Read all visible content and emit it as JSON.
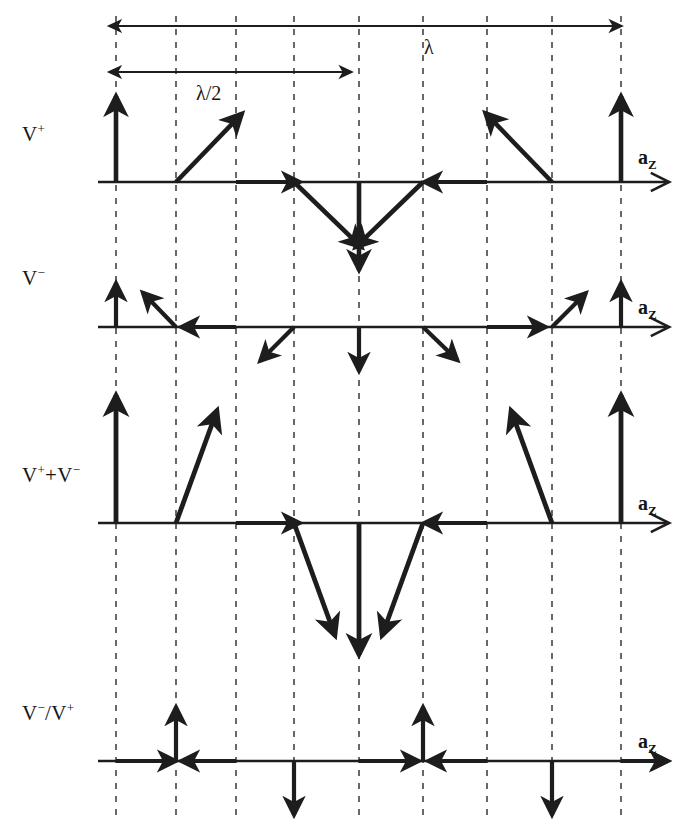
{
  "figure": {
    "type": "vector-phasor-diagram",
    "width": 695,
    "height": 823,
    "ink_color": "#1d1d1d",
    "grid_color": "#444444"
  },
  "span_markers": [
    {
      "name": "lambda",
      "label": "λ",
      "x_start": 116,
      "x_end": 621,
      "y": 26,
      "label_x": 424,
      "label_y": 36,
      "arrows": "both"
    },
    {
      "name": "lambda-half",
      "label": "λ/2",
      "x_start": 116,
      "x_end": 351,
      "y": 72,
      "label_x": 196,
      "label_y": 82,
      "arrows": "both"
    }
  ],
  "gridlines": {
    "x": [
      116,
      176,
      236,
      294,
      359,
      423,
      487,
      552,
      621
    ],
    "y_top": 16,
    "y_bottom": 818,
    "dash": "6 7",
    "width": 1.6
  },
  "axis_label": {
    "text": "a",
    "sub": "Z"
  },
  "rows": [
    {
      "id": "v-plus",
      "label": "V",
      "label_sup": "+",
      "label_x": 22,
      "label_y": 121,
      "axis_y": 182,
      "axis_x_start": 98,
      "axis_x_end": 666,
      "axis_label_x": 638,
      "axis_label_y": 146,
      "vectors": [
        {
          "gx": 116,
          "angle_deg": 90,
          "length": 86,
          "lw": 4.6
        },
        {
          "gx": 176,
          "angle_deg": 46,
          "length": 95,
          "lw": 4.6
        },
        {
          "gx": 236,
          "angle_deg": 0,
          "length": 0,
          "lw": 4.6
        },
        {
          "gx": 294,
          "angle_deg": -44,
          "length": 94,
          "lw": 4.6
        },
        {
          "gx": 359,
          "angle_deg": -90,
          "length": 88,
          "lw": 4.6
        },
        {
          "gx": 423,
          "angle_deg": -136,
          "length": 94,
          "lw": 4.6
        },
        {
          "gx": 487,
          "angle_deg": 180,
          "length": 0,
          "lw": 4.6
        },
        {
          "gx": 552,
          "angle_deg": 134,
          "length": 96,
          "lw": 4.6
        },
        {
          "gx": 621,
          "angle_deg": 90,
          "length": 86,
          "lw": 4.6
        }
      ],
      "inline_arrows": [
        {
          "x": 236,
          "dir": "right",
          "to": 300
        },
        {
          "x": 487,
          "dir": "left",
          "to": 424
        }
      ]
    },
    {
      "id": "v-minus",
      "label": "V",
      "label_sup": "−",
      "label_x": 22,
      "label_y": 265,
      "axis_y": 327,
      "axis_x_start": 98,
      "axis_x_end": 666,
      "axis_label_x": 638,
      "axis_label_y": 296,
      "vectors": [
        {
          "gx": 116,
          "angle_deg": 90,
          "length": 44,
          "lw": 4.2
        },
        {
          "gx": 176,
          "angle_deg": 134,
          "length": 48,
          "lw": 4.2
        },
        {
          "gx": 236,
          "angle_deg": 180,
          "length": 0,
          "lw": 4.2
        },
        {
          "gx": 294,
          "angle_deg": -135,
          "length": 48,
          "lw": 4.2
        },
        {
          "gx": 359,
          "angle_deg": -90,
          "length": 44,
          "lw": 4.2
        },
        {
          "gx": 423,
          "angle_deg": -44,
          "length": 48,
          "lw": 4.2
        },
        {
          "gx": 487,
          "angle_deg": 0,
          "length": 0,
          "lw": 4.2
        },
        {
          "gx": 552,
          "angle_deg": 45,
          "length": 48,
          "lw": 4.2
        },
        {
          "gx": 621,
          "angle_deg": 90,
          "length": 44,
          "lw": 4.2
        }
      ],
      "inline_arrows": [
        {
          "x": 236,
          "dir": "left",
          "to": 181
        },
        {
          "x": 487,
          "dir": "right",
          "to": 546
        }
      ]
    },
    {
      "id": "v-plus-plus-v-minus",
      "label": "V",
      "label_sup": "+",
      "label2": "+V",
      "label2_sup": "−",
      "label_x": 22,
      "label_y": 462,
      "axis_y": 523,
      "axis_x_start": 98,
      "axis_x_end": 666,
      "axis_label_x": 638,
      "axis_label_y": 492,
      "vectors": [
        {
          "gx": 116,
          "angle_deg": 90,
          "length": 128,
          "lw": 4.8
        },
        {
          "gx": 176,
          "angle_deg": 70,
          "length": 120,
          "lw": 4.8
        },
        {
          "gx": 236,
          "angle_deg": 0,
          "length": 0,
          "lw": 4.8
        },
        {
          "gx": 294,
          "angle_deg": -70,
          "length": 120,
          "lw": 4.8
        },
        {
          "gx": 359,
          "angle_deg": -90,
          "length": 132,
          "lw": 4.8
        },
        {
          "gx": 423,
          "angle_deg": -110,
          "length": 120,
          "lw": 4.8
        },
        {
          "gx": 487,
          "angle_deg": 180,
          "length": 0,
          "lw": 4.8
        },
        {
          "gx": 552,
          "angle_deg": 110,
          "length": 120,
          "lw": 4.8
        },
        {
          "gx": 621,
          "angle_deg": 90,
          "length": 128,
          "lw": 4.8
        }
      ],
      "inline_arrows": [
        {
          "x": 236,
          "dir": "right",
          "to": 300
        },
        {
          "x": 487,
          "dir": "left",
          "to": 424
        }
      ]
    },
    {
      "id": "v-minus-over-v-plus",
      "label": "V",
      "label_sup": "−",
      "label2": "/V",
      "label2_sup": "+",
      "label_x": 22,
      "label_y": 700,
      "axis_y": 761,
      "axis_x_start": 98,
      "axis_x_end": 666,
      "axis_label_x": 638,
      "axis_label_y": 730,
      "vectors": [
        {
          "gx": 116,
          "angle_deg": 0,
          "length": 0,
          "lw": 4.2
        },
        {
          "gx": 176,
          "angle_deg": 90,
          "length": 54,
          "lw": 4.2
        },
        {
          "gx": 236,
          "angle_deg": 180,
          "length": 0,
          "lw": 4.2
        },
        {
          "gx": 294,
          "angle_deg": -90,
          "length": 54,
          "lw": 4.2
        },
        {
          "gx": 359,
          "angle_deg": 0,
          "length": 0,
          "lw": 4.2
        },
        {
          "gx": 423,
          "angle_deg": 90,
          "length": 54,
          "lw": 4.2
        },
        {
          "gx": 487,
          "angle_deg": 180,
          "length": 0,
          "lw": 4.2
        },
        {
          "gx": 552,
          "angle_deg": -90,
          "length": 54,
          "lw": 4.2
        },
        {
          "gx": 621,
          "angle_deg": 0,
          "length": 0,
          "lw": 4.2
        }
      ],
      "inline_arrows": [
        {
          "x": 116,
          "dir": "right",
          "to": 176
        },
        {
          "x": 236,
          "dir": "left",
          "to": 181
        },
        {
          "x": 359,
          "dir": "right",
          "to": 419
        },
        {
          "x": 487,
          "dir": "left",
          "to": 428
        },
        {
          "x": 621,
          "dir": "right",
          "to": 668
        }
      ]
    }
  ]
}
